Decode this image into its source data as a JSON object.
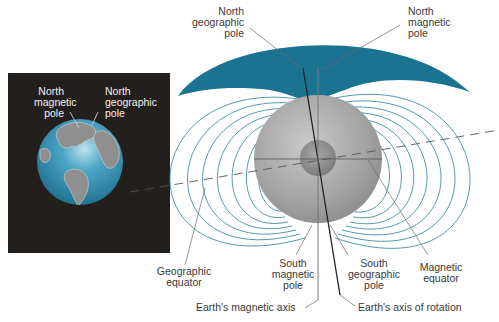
{
  "diagram": {
    "colors": {
      "field_lines": "#3f8fa6",
      "field_cap": "#1a7390",
      "inset_bg": "#231f1c",
      "earth_ocean": "#2a86a8",
      "earth_land": "#8c8c8c",
      "sphere": "#a6a6a6",
      "core": "#8a8a8a",
      "label_text": "#3a3a3a"
    },
    "inset": {
      "labels": {
        "north_magnetic_pole": "North\nmagnetic\npole",
        "north_geographic_pole": "North\ngeographic\npole"
      }
    },
    "labels": {
      "north_geographic_pole": "North\ngeographic\npole",
      "north_magnetic_pole": "North\nmagnetic\npole",
      "geographic_equator": "Geographic\nequator",
      "south_magnetic_pole": "South\nmagnetic\npole",
      "south_geographic_pole": "South\ngeographic\npole",
      "magnetic_equator": "Magnetic\nequator",
      "magnetic_axis": "Earth's magnetic axis",
      "axis_of_rotation": "Earth's axis of rotation"
    }
  }
}
